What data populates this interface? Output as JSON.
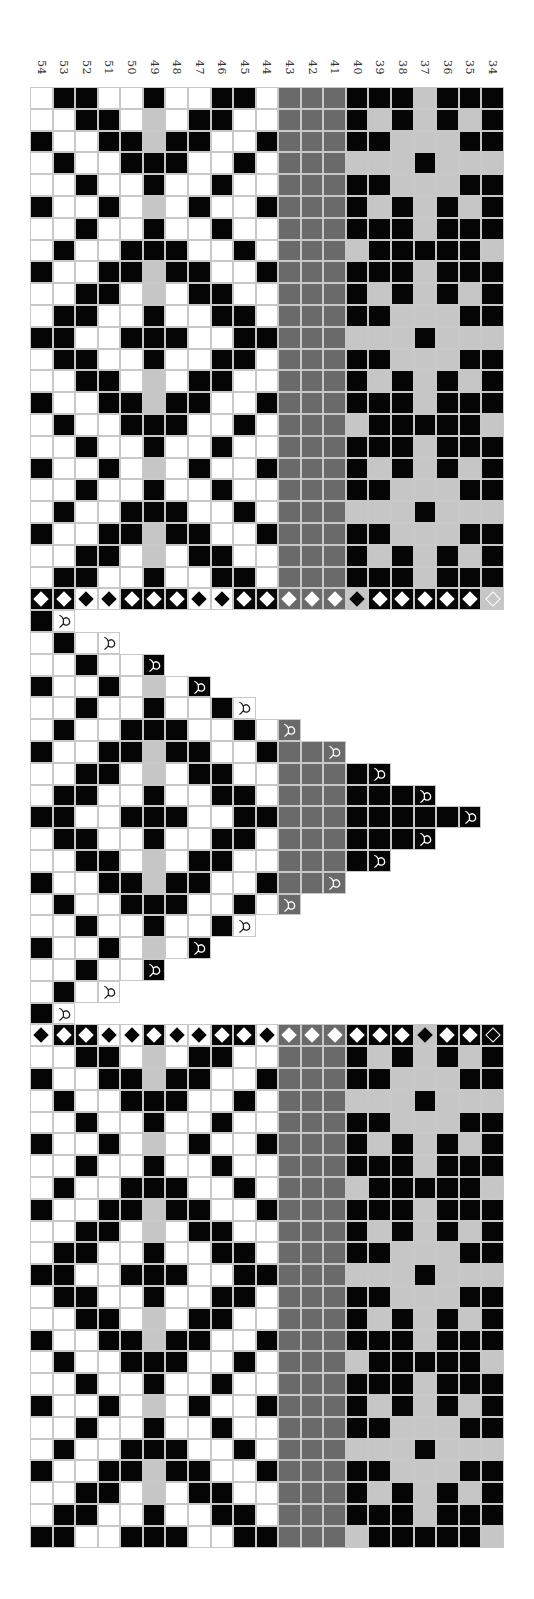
{
  "draft": {
    "column_labels": [
      "54",
      "53",
      "52",
      "51",
      "50",
      "49",
      "48",
      "47",
      "46",
      "45",
      "44",
      "43",
      "42",
      "41",
      "40",
      "39",
      "38",
      "37",
      "36",
      "35",
      "34"
    ],
    "legend": {
      "W": "white",
      "B": "black",
      "L": "light gray",
      "D": "dark gray"
    },
    "colors": {
      "W": "#ffffff",
      "B": "#050505",
      "L": "#c6c6c6",
      "D": "#6a6a6a",
      "grid_line": "#c8c8c8"
    },
    "top_grid": [
      "WBBWWBWWBBWDDDBBBLBBB",
      "WWBBWLWBBWWDDDBLBLBLB",
      "BWWBBLBBWWBDDDBBLLLBB",
      "WBWWBBBWWBWDDDLLLBLLL",
      "WWBWWBWWBWWDDDBBLLLBB",
      "BWWBWLWBWWBDDDBLBLBLB",
      "WWBWWBWWBWWDDDBBBLBBB",
      "WBWWBBBWWBWDDDLBBBBBL",
      "BWWBBLBBWWBDDDBBBLBBB",
      "WWBBWLWBBWWDDDBLBLBLB",
      "WBBWWBWWBBWDDDBBLLLBB",
      "BBWWBBBWWBBDDDLLLBLLL",
      "WBBWWBWWBBWDDDBBLLLBB",
      "WWBBWLWBBWWDDDBLBLBLB",
      "BWWBBLBBWWBDDDBBBLBBB",
      "WBWWBBBWWBWDDDLBBBBBL",
      "WWBWWBWWBWWDDDBBBLBBB",
      "BWWBWLWBWWBDDDBLBLBLB",
      "WWBWWBWWBWWDDDBBLLLBB",
      "WBWWBBBWWBWDDDLLLBLLL",
      "BWWBBLBBWWBDDDBBLLLBB",
      "WWBBWLWBBWWDDDBLBLBLB",
      "WBBWWBWWBBWDDDBBBLBBB"
    ],
    "top_diamond_row": [
      {
        "bg": "B",
        "d": "white"
      },
      {
        "bg": "B",
        "d": "white"
      },
      {
        "bg": "W",
        "d": "black"
      },
      {
        "bg": "W",
        "d": "black"
      },
      {
        "bg": "B",
        "d": "white"
      },
      {
        "bg": "B",
        "d": "white"
      },
      {
        "bg": "B",
        "d": "white"
      },
      {
        "bg": "W",
        "d": "black"
      },
      {
        "bg": "W",
        "d": "black"
      },
      {
        "bg": "B",
        "d": "white"
      },
      {
        "bg": "B",
        "d": "white"
      },
      {
        "bg": "D",
        "d": "white"
      },
      {
        "bg": "D",
        "d": "white"
      },
      {
        "bg": "D",
        "d": "white"
      },
      {
        "bg": "L",
        "d": "black"
      },
      {
        "bg": "B",
        "d": "white"
      },
      {
        "bg": "B",
        "d": "white"
      },
      {
        "bg": "B",
        "d": "white"
      },
      {
        "bg": "B",
        "d": "white"
      },
      {
        "bg": "B",
        "d": "white"
      },
      {
        "bg": "L",
        "d": "outline"
      }
    ],
    "triangle": [
      "BW",
      "WBWW",
      "WWBWWB",
      "BWWBWLWB",
      "WWBWWBWWBW",
      "WBWWBBBWWBWD",
      "BWWBBLBBWWBDDD",
      "WWBBWLWBBWWDDDBB",
      "WBBWWBWWBBWDDDBBBB",
      "BBWWBBBWWBBDDDBBBBBB",
      "WBBWWBWWBBWDDDBBBB",
      "WWBBWLWBBWWDDDBB",
      "BWWBBLBBWWBDDD",
      "WBWWBBBWWBWD",
      "WWBWWBWWBW",
      "BWWBWLWB",
      "WWBWWB",
      "WBWW",
      "BW"
    ],
    "triangle_marker": "fish-symbol on last cell of each row",
    "bottom_diamond_row": [
      {
        "bg": "W",
        "d": "black"
      },
      {
        "bg": "B",
        "d": "white"
      },
      {
        "bg": "B",
        "d": "white"
      },
      {
        "bg": "W",
        "d": "black"
      },
      {
        "bg": "W",
        "d": "black"
      },
      {
        "bg": "B",
        "d": "white"
      },
      {
        "bg": "W",
        "d": "black"
      },
      {
        "bg": "W",
        "d": "black"
      },
      {
        "bg": "B",
        "d": "white"
      },
      {
        "bg": "B",
        "d": "white"
      },
      {
        "bg": "W",
        "d": "black"
      },
      {
        "bg": "D",
        "d": "white"
      },
      {
        "bg": "D",
        "d": "white"
      },
      {
        "bg": "D",
        "d": "white"
      },
      {
        "bg": "B",
        "d": "white"
      },
      {
        "bg": "B",
        "d": "white"
      },
      {
        "bg": "B",
        "d": "white"
      },
      {
        "bg": "L",
        "d": "black"
      },
      {
        "bg": "B",
        "d": "white"
      },
      {
        "bg": "B",
        "d": "white"
      },
      {
        "bg": "B",
        "d": "outline"
      }
    ],
    "bottom_grid": [
      "WWBBWLWBBWWDDDBLBLBLB",
      "BWWBBLBBWWBDDDBBLLLBB",
      "WBWWBBBWWBWDDDLLLBLLL",
      "WWBWWBWWBWWDDDBBLLLBB",
      "BWWBWLWBWWBDDDBLBLBLB",
      "WWBWWBWWBWWDDDBBBLBBB",
      "WBWWBBBWWBWDDDLBBBBBL",
      "BWWBBLBBWWBDDDBBBLBBB",
      "WWBBWLWBBWWDDDBLBLBLB",
      "WBBWWBWWBBWDDDBBLLLBB",
      "BBWWBBBWWBBDDDLLLBLLL",
      "WBBWWBWWBBWDDDBBLLLBB",
      "WWBBWLWBBWWDDDBLBLBLB",
      "BWWBBLBBWWBDDDBBBLBBB",
      "WBWWBBBWWBWDDDLBBBBBL",
      "WWBWWBWWBWWDDDBBBLBBB",
      "BWWBWLWBWWBDDDBLBLBLB",
      "WWBWWBWWBWWDDDBBLLLBB",
      "WBWWBBBWWBWDDDLLLBLLL",
      "BWWBBLBBWWBDDDBBLLLBB",
      "WWBBWLWBBWWDDDBLBLBLB",
      "WBBWWBWWBBWDDDBBBLBBB",
      "BBWWBBBWWBBDDDLBBBBBL"
    ]
  }
}
